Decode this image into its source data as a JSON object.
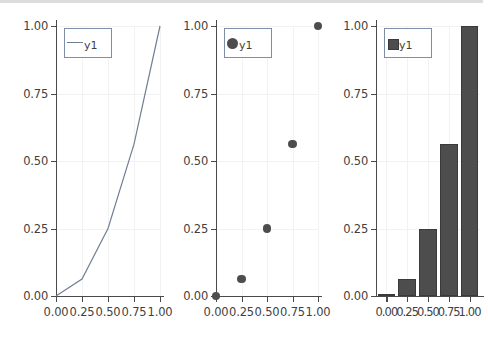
{
  "figure": {
    "background": "#ffffff",
    "panel_count": 3,
    "axis_color": "#4a4a4a",
    "grid_color": "#f2f2f2",
    "legend_border_color": "#7d8fa8",
    "line_color": "#6f7f93",
    "marker_color": "#4d4d4d",
    "bar_color": "#4d4d4d"
  },
  "chart_data": [
    {
      "type": "line",
      "title": "",
      "xlabel": "",
      "ylabel": "",
      "xlim": [
        0.0,
        1.0
      ],
      "ylim": [
        0.0,
        1.0
      ],
      "grid": true,
      "legend": {
        "position": "top-left",
        "entries": [
          "y1"
        ],
        "marker": "line"
      },
      "xticks": [
        "0.00",
        "0.25",
        "0.50",
        "0.75",
        "1.00"
      ],
      "yticks": [
        "0.00",
        "0.25",
        "0.50",
        "0.75",
        "1.00"
      ],
      "xtick_values": [
        0.0,
        0.25,
        0.5,
        0.75,
        1.0
      ],
      "ytick_values": [
        0.0,
        0.25,
        0.5,
        0.75,
        1.0
      ],
      "series": [
        {
          "name": "y1",
          "x": [
            0.0,
            0.25,
            0.5,
            0.75,
            1.0
          ],
          "values": [
            0.0,
            0.0625,
            0.25,
            0.5625,
            1.0
          ]
        }
      ]
    },
    {
      "type": "scatter",
      "title": "",
      "xlabel": "",
      "ylabel": "",
      "xlim": [
        0.0,
        1.0
      ],
      "ylim": [
        0.0,
        1.0
      ],
      "grid": true,
      "legend": {
        "position": "top-left",
        "entries": [
          "y1"
        ],
        "marker": "circle"
      },
      "xticks": [
        "0.00",
        "0.25",
        "0.50",
        "0.75",
        "1.00"
      ],
      "yticks": [
        "0.00",
        "0.25",
        "0.50",
        "0.75",
        "1.00"
      ],
      "xtick_values": [
        0.0,
        0.25,
        0.5,
        0.75,
        1.0
      ],
      "ytick_values": [
        0.0,
        0.25,
        0.5,
        0.75,
        1.0
      ],
      "series": [
        {
          "name": "y1",
          "x": [
            0.0,
            0.25,
            0.5,
            0.75,
            1.0
          ],
          "values": [
            0.0,
            0.0625,
            0.25,
            0.5625,
            1.0
          ]
        }
      ]
    },
    {
      "type": "bar",
      "title": "",
      "xlabel": "",
      "ylabel": "",
      "xlim": [
        -0.125,
        1.125
      ],
      "ylim": [
        0.0,
        1.0
      ],
      "grid": true,
      "legend": {
        "position": "top-left",
        "entries": [
          "y1"
        ],
        "marker": "square"
      },
      "xticks": [
        "0.00",
        "0.25",
        "0.50",
        "0.75",
        "1.00"
      ],
      "yticks": [
        "0.00",
        "0.25",
        "0.50",
        "0.75",
        "1.00"
      ],
      "xtick_values": [
        0.0,
        0.25,
        0.5,
        0.75,
        1.0
      ],
      "ytick_values": [
        0.0,
        0.25,
        0.5,
        0.75,
        1.0
      ],
      "categories": [
        "0.00",
        "0.25",
        "0.50",
        "0.75",
        "1.00"
      ],
      "series": [
        {
          "name": "y1",
          "x": [
            0.0,
            0.25,
            0.5,
            0.75,
            1.0
          ],
          "values": [
            0.0,
            0.0625,
            0.25,
            0.5625,
            1.0
          ]
        }
      ]
    }
  ]
}
